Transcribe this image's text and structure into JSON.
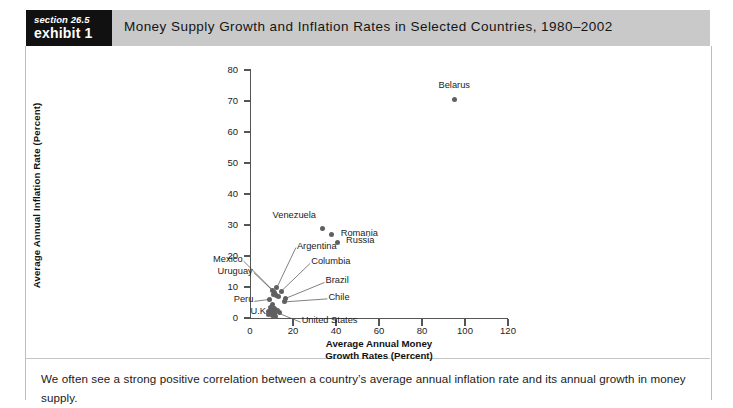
{
  "header": {
    "section_label": "section 26.5",
    "exhibit_label": "exhibit 1",
    "title": "Money Supply Growth and Inflation Rates in Selected Countries, 1980–2002",
    "band_color": "#c9c9c9",
    "tag_color": "#111111"
  },
  "caption": {
    "text": "We often see a strong positive correlation between a country’s average annual inflation rate and its annual growth in money supply."
  },
  "chart_data": {
    "type": "scatter",
    "title": "Money Supply Growth and Inflation Rates in Selected Countries, 1980–2002",
    "xlabel_line1": "Average Annual Money",
    "xlabel_line2": "Growth Rates (Percent)",
    "ylabel": "Average Annual Inflation Rate (Percent)",
    "xlim": [
      0,
      120
    ],
    "ylim": [
      0,
      80
    ],
    "xticks": [
      0,
      20,
      40,
      60,
      80,
      100,
      120
    ],
    "yticks": [
      0,
      10,
      20,
      30,
      40,
      50,
      60,
      70,
      80
    ],
    "grid": false,
    "legend": "none",
    "marker_color": "#606060",
    "points": [
      {
        "label": "Belarus",
        "x": 95,
        "y": 70.5,
        "label_dx": 0,
        "label_dy": -13,
        "label_anchor": "center",
        "leader": false
      },
      {
        "label": "Venezuela",
        "x": 33.5,
        "y": 28.8,
        "label_dx": -6,
        "label_dy": -13,
        "label_anchor": "end",
        "leader": false
      },
      {
        "label": "Romania",
        "x": 38,
        "y": 26.8,
        "label_dx": 9,
        "label_dy": -1,
        "label_anchor": "start",
        "leader": false
      },
      {
        "label": "Russia",
        "x": 40.5,
        "y": 24.5,
        "label_dx": 9,
        "label_dy": -1,
        "label_anchor": "start",
        "leader": false
      },
      {
        "label": "Argentina",
        "x": 12.5,
        "y": 9.8,
        "label_dx": 20,
        "label_dy": -41,
        "label_anchor": "start",
        "leader": true
      },
      {
        "label": "Columbia",
        "x": 14.5,
        "y": 8.6,
        "label_dx": 30,
        "label_dy": -29,
        "label_anchor": "start",
        "leader": true
      },
      {
        "label": "Mexico",
        "x": 10.5,
        "y": 9.0,
        "label_dx": -30,
        "label_dy": -30,
        "label_anchor": "end",
        "leader": true
      },
      {
        "label": "Uruguay",
        "x": 11.5,
        "y": 8.2,
        "label_dx": -22,
        "label_dy": -21,
        "label_anchor": "end",
        "leader": true
      },
      {
        "label": "Brazil",
        "x": 16.5,
        "y": 6.3,
        "label_dx": 40,
        "label_dy": -17,
        "label_anchor": "start",
        "leader": true
      },
      {
        "label": "Chile",
        "x": 16,
        "y": 5.2,
        "label_dx": 44,
        "label_dy": -4,
        "label_anchor": "start",
        "leader": true
      },
      {
        "label": "Peru",
        "x": 9,
        "y": 6.0,
        "label_dx": -16,
        "label_dy": 1,
        "label_anchor": "end",
        "leader": true
      },
      {
        "label": "U.K.",
        "x": 10.5,
        "y": 4.2,
        "label_dx": -4,
        "label_dy": 7,
        "label_anchor": "end",
        "leader": true
      },
      {
        "label": "United States",
        "x": 11,
        "y": 2.2,
        "label_dx": 28,
        "label_dy": 10,
        "label_anchor": "start",
        "leader": true
      },
      {
        "label": "",
        "x": 12.2,
        "y": 7.2,
        "leader": false
      },
      {
        "label": "",
        "x": 13.2,
        "y": 6.9,
        "leader": false
      },
      {
        "label": "",
        "x": 10.8,
        "y": 7.6,
        "leader": false
      },
      {
        "label": "",
        "x": 9.6,
        "y": 3.4,
        "leader": false
      },
      {
        "label": "",
        "x": 10.2,
        "y": 2.8,
        "leader": false
      },
      {
        "label": "",
        "x": 11.6,
        "y": 3.0,
        "leader": false
      },
      {
        "label": "",
        "x": 12.6,
        "y": 2.4,
        "leader": false
      },
      {
        "label": "",
        "x": 8.8,
        "y": 2.0,
        "leader": false
      },
      {
        "label": "",
        "x": 9.8,
        "y": 1.6,
        "leader": false
      },
      {
        "label": "",
        "x": 11.2,
        "y": 1.4,
        "leader": false
      },
      {
        "label": "",
        "x": 13.6,
        "y": 1.8,
        "leader": false
      },
      {
        "label": "",
        "x": 8.4,
        "y": 1.0,
        "leader": false
      },
      {
        "label": "",
        "x": 10.6,
        "y": 0.8,
        "leader": false
      },
      {
        "label": "",
        "x": 12.0,
        "y": 0.6,
        "leader": false
      }
    ]
  }
}
